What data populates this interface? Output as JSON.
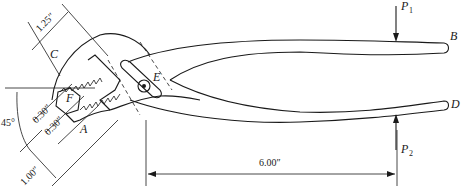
{
  "figure": {
    "type": "engineering-diagram"
  },
  "labels": {
    "B": "B",
    "C": "C",
    "D": "D",
    "E": "E",
    "F": "F",
    "A": "A",
    "P1": "P",
    "P1_sub": "1",
    "P2": "P",
    "P2_sub": "2"
  },
  "dimensions": {
    "jaw_length": "1.25″",
    "angle": "45°",
    "offset_1": "0.30″",
    "offset_2": "0.30″",
    "bottom_width": "1.00″",
    "handle_length": "6.00″"
  },
  "colors": {
    "ink": "#1a1a1a",
    "background": "#ffffff"
  }
}
